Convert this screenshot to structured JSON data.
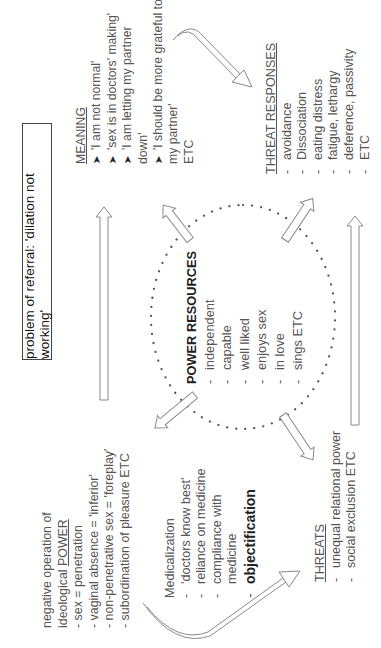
{
  "title": "problem of referral: 'dilation not working'",
  "meaning": {
    "heading": "MEANING",
    "bullet_glyph": "➤",
    "items": [
      {
        "lines": [
          "'I am not normal'"
        ]
      },
      {
        "lines": [
          "'sex is in doctors' making'"
        ]
      },
      {
        "lines": [
          "'I am letting my partner",
          "down'"
        ]
      },
      {
        "lines": [
          "'I should be more grateful to",
          "my partner'"
        ]
      }
    ],
    "etc": "ETC"
  },
  "threat_responses": {
    "heading": "THREAT RESPONSES",
    "items": [
      "avoidance",
      "Dissociation",
      "eating distress",
      "fatigue, lethargy",
      "deference, passivity"
    ],
    "etc": "ETC"
  },
  "ideological_power": {
    "line1": "negative operation of",
    "line2_prefix": "ideological ",
    "line2_emph": "POWER",
    "items": [
      "- sex = penetration",
      "- vaginal absence = 'inferior'",
      "- non-penetrative sex = 'foreplay'",
      "- subordination of pleasure ETC"
    ]
  },
  "medicalization": {
    "heading": "Medicalization",
    "items": [
      {
        "lines": [
          "'doctors know best'"
        ],
        "bold": false
      },
      {
        "lines": [
          "reliance on medicine"
        ],
        "bold": false
      },
      {
        "lines": [
          "compliance with",
          "medicine"
        ],
        "bold": false
      },
      {
        "lines": [
          "objectification"
        ],
        "bold": true
      }
    ]
  },
  "threats": {
    "heading": "THREATS",
    "items": [
      "unequal relational power",
      "social exclusion ETC"
    ]
  },
  "power_resources": {
    "heading": "POWER RESOURCES",
    "items": [
      "independent",
      "capable",
      "well liked",
      "enjoys sex",
      "in love",
      "sings ETC"
    ]
  },
  "colors": {
    "text": "#555555",
    "arrow_stroke": "#8a8a8a",
    "dots": "#555555",
    "box_border": "#444444"
  },
  "orientation": "rotated 90deg counterclockwise"
}
